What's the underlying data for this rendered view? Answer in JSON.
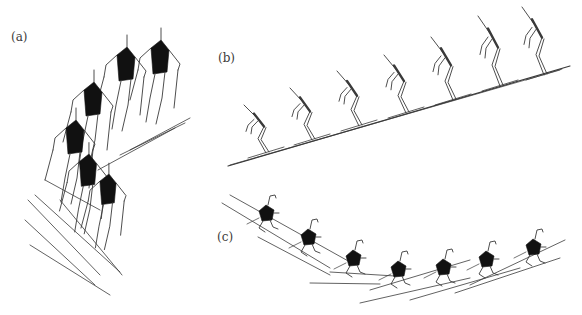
{
  "figure": {
    "colors": {
      "background": "#ffffff",
      "stroke": "#3a3a3a",
      "torso_fill": "#111111"
    },
    "panels": [
      {
        "id": "a",
        "label": "(a)",
        "view": "front/oblique view, descending",
        "figure_count": 6
      },
      {
        "id": "b",
        "label": "(b)",
        "view": "side view on incline",
        "figure_count": 7
      },
      {
        "id": "c",
        "label": "(c)",
        "view": "traverse along curved path",
        "figure_count": 7
      }
    ]
  }
}
